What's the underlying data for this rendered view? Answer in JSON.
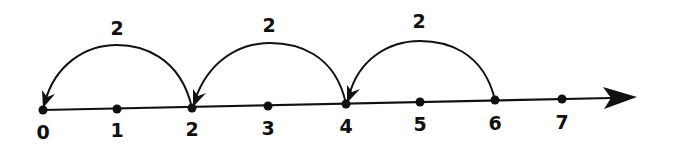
{
  "diagram": {
    "type": "number-line",
    "ticks": [
      {
        "label": "0",
        "x": 43,
        "y": 110
      },
      {
        "label": "1",
        "x": 117,
        "y": 109
      },
      {
        "label": "2",
        "x": 192,
        "y": 108
      },
      {
        "label": "3",
        "x": 268,
        "y": 106
      },
      {
        "label": "4",
        "x": 346,
        "y": 104
      },
      {
        "label": "5",
        "x": 420,
        "y": 102
      },
      {
        "label": "6",
        "x": 495,
        "y": 100
      },
      {
        "label": "7",
        "x": 562,
        "y": 99
      }
    ],
    "jumps": [
      {
        "label": "2",
        "from": "2",
        "to": "0"
      },
      {
        "label": "2",
        "from": "4",
        "to": "2"
      },
      {
        "label": "2",
        "from": "6",
        "to": "4"
      }
    ],
    "line_color": "#111111"
  }
}
